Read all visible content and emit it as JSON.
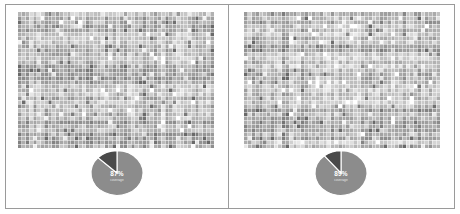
{
  "figure": {
    "layout": "two-panel-side-by-side",
    "background_color": "#ffffff",
    "frame_color": "#9a9a9a",
    "divider_color": "#9d9d9d"
  },
  "panels": [
    {
      "id": "left",
      "name": "panel-left",
      "heatmap": {
        "type": "heatmap",
        "title": "",
        "xlabel": "",
        "ylabel": "",
        "rows": 34,
        "cols": 52,
        "colormap": "grayscale",
        "value_min": 0,
        "value_max": 1,
        "grid": true,
        "grid_color": "#ffffff",
        "seed": 10771
      },
      "pie": {
        "type": "pie",
        "labels": [
          "major",
          "minor"
        ],
        "values": [
          87,
          13
        ],
        "center_label": "87%",
        "sub_label": "coverage",
        "colors": [
          "#8c8c8c",
          "#4a4a4a"
        ],
        "separator_color": "#ffffff",
        "start_angle_deg": 0,
        "radius_px": 26,
        "squash": 0.86
      }
    },
    {
      "id": "right",
      "name": "panel-right",
      "heatmap": {
        "type": "heatmap",
        "title": "",
        "xlabel": "",
        "ylabel": "",
        "rows": 34,
        "cols": 52,
        "colormap": "grayscale",
        "value_min": 0,
        "value_max": 1,
        "grid": true,
        "grid_color": "#ffffff",
        "seed": 48293
      },
      "pie": {
        "type": "pie",
        "labels": [
          "major",
          "minor"
        ],
        "values": [
          89,
          11
        ],
        "center_label": "89%",
        "sub_label": "coverage",
        "colors": [
          "#8c8c8c",
          "#4a4a4a"
        ],
        "separator_color": "#ffffff",
        "start_angle_deg": 0,
        "radius_px": 26,
        "squash": 0.86
      }
    }
  ],
  "chart_data": [
    {
      "type": "heatmap",
      "panel": "left",
      "title": "",
      "xlabel": "",
      "ylabel": "",
      "rows": 34,
      "cols": 52,
      "colormap": "grayscale",
      "value_range": [
        0,
        1
      ],
      "legend": "none",
      "grid": true
    },
    {
      "type": "pie",
      "panel": "left",
      "title": "",
      "categories": [
        "major",
        "minor"
      ],
      "values": [
        87,
        13
      ],
      "labels": [
        "87%",
        ""
      ],
      "annotation": "87%",
      "sub_annotation": "coverage",
      "legend": "none"
    },
    {
      "type": "heatmap",
      "panel": "right",
      "title": "",
      "xlabel": "",
      "ylabel": "",
      "rows": 34,
      "cols": 52,
      "colormap": "grayscale",
      "value_range": [
        0,
        1
      ],
      "legend": "none",
      "grid": true
    },
    {
      "type": "pie",
      "panel": "right",
      "title": "",
      "categories": [
        "major",
        "minor"
      ],
      "values": [
        89,
        11
      ],
      "labels": [
        "89%",
        ""
      ],
      "annotation": "89%",
      "sub_annotation": "coverage",
      "legend": "none"
    }
  ]
}
